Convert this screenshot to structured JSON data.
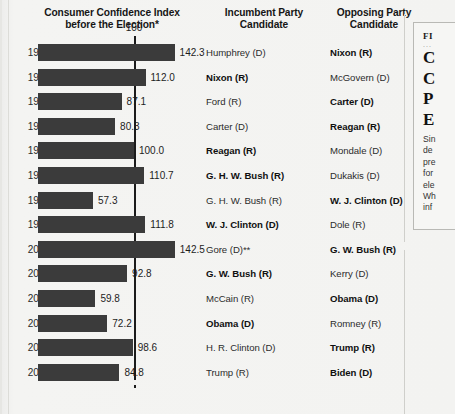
{
  "headers": {
    "chart": "Consumer Confidence Index before the Election*",
    "chart_line1": "Consumer Confidence Index",
    "chart_line2": "before the Election*",
    "incumbent_line1": "Incumbent Party",
    "incumbent_line2": "Candidate",
    "opposing_line1": "Opposing Party",
    "opposing_line2": "Candidate"
  },
  "reference": {
    "label": "100",
    "value": 100
  },
  "side_panel": {
    "kicker": "FI",
    "dots": "...",
    "title_lines": [
      "C",
      "C",
      "P",
      "E"
    ],
    "body_lines": [
      "Sin",
      "de",
      "pre",
      "for",
      "ele",
      "Wh",
      "inf"
    ]
  },
  "chart_data": {
    "type": "bar",
    "title": "Consumer Confidence Index before the Election*",
    "xlabel": "",
    "ylabel": "",
    "orientation": "horizontal",
    "grid": false,
    "reference_line": 100,
    "xlim": [
      0,
      150
    ],
    "categories": [
      "1968",
      "1972",
      "1976",
      "1980",
      "1984",
      "1988",
      "1992",
      "1996",
      "2000",
      "2004",
      "2008",
      "2012",
      "2016",
      "2020"
    ],
    "values": [
      142.3,
      112.0,
      87.1,
      80.3,
      100.0,
      110.7,
      57.3,
      111.8,
      142.5,
      92.8,
      59.8,
      72.2,
      98.6,
      84.8
    ],
    "value_labels": [
      "142.3",
      "112.0",
      "87.1",
      "80.3",
      "100.0",
      "110.7",
      "57.3",
      "111.8",
      "142.5",
      "92.8",
      "59.8",
      "72.2",
      "98.6",
      "84.8"
    ],
    "bar_color": "#3b3b3b",
    "series": [
      {
        "name": "Consumer Confidence Index",
        "values": [
          142.3,
          112.0,
          87.1,
          80.3,
          100.0,
          110.7,
          57.3,
          111.8,
          142.5,
          92.8,
          59.8,
          72.2,
          98.6,
          84.8
        ]
      }
    ]
  },
  "rows": [
    {
      "year": "1968",
      "value_label": "142.3",
      "value": 142.3,
      "incumbent": "Humphrey (D)",
      "incumbent_won": false,
      "opposing": "Nixon (R)",
      "opposing_won": true
    },
    {
      "year": "1972",
      "value_label": "112.0",
      "value": 112.0,
      "incumbent": "Nixon (R)",
      "incumbent_won": true,
      "opposing": "McGovern (D)",
      "opposing_won": false
    },
    {
      "year": "1976",
      "value_label": "87.1",
      "value": 87.1,
      "incumbent": "Ford (R)",
      "incumbent_won": false,
      "opposing": "Carter (D)",
      "opposing_won": true
    },
    {
      "year": "1980",
      "value_label": "80.3",
      "value": 80.3,
      "incumbent": "Carter (D)",
      "incumbent_won": false,
      "opposing": "Reagan (R)",
      "opposing_won": true
    },
    {
      "year": "1984",
      "value_label": "100.0",
      "value": 100.0,
      "incumbent": "Reagan (R)",
      "incumbent_won": true,
      "opposing": "Mondale (D)",
      "opposing_won": false
    },
    {
      "year": "1988",
      "value_label": "110.7",
      "value": 110.7,
      "incumbent": "G. H. W. Bush (R)",
      "incumbent_won": true,
      "opposing": "Dukakis (D)",
      "opposing_won": false
    },
    {
      "year": "1992",
      "value_label": "57.3",
      "value": 57.3,
      "incumbent": "G. H. W. Bush (R)",
      "incumbent_won": false,
      "opposing": "W. J. Clinton (D)",
      "opposing_won": true
    },
    {
      "year": "1996",
      "value_label": "111.8",
      "value": 111.8,
      "incumbent": "W. J. Clinton (D)",
      "incumbent_won": true,
      "opposing": "Dole (R)",
      "opposing_won": false
    },
    {
      "year": "2000",
      "value_label": "142.5",
      "value": 142.5,
      "incumbent": "Gore (D)**",
      "incumbent_won": false,
      "opposing": "G. W. Bush (R)",
      "opposing_won": true
    },
    {
      "year": "2004",
      "value_label": "92.8",
      "value": 92.8,
      "incumbent": "G. W. Bush (R)",
      "incumbent_won": true,
      "opposing": "Kerry (D)",
      "opposing_won": false
    },
    {
      "year": "2008",
      "value_label": "59.8",
      "value": 59.8,
      "incumbent": "McCain (R)",
      "incumbent_won": false,
      "opposing": "Obama (D)",
      "opposing_won": true
    },
    {
      "year": "2012",
      "value_label": "72.2",
      "value": 72.2,
      "incumbent": "Obama (D)",
      "incumbent_won": true,
      "opposing": "Romney (R)",
      "opposing_won": false
    },
    {
      "year": "2016",
      "value_label": "98.6",
      "value": 98.6,
      "incumbent": "H. R. Clinton (D)",
      "incumbent_won": false,
      "opposing": "Trump (R)",
      "opposing_won": true
    },
    {
      "year": "2020",
      "value_label": "84.8",
      "value": 84.8,
      "incumbent": "Trump (R)",
      "incumbent_won": false,
      "opposing": "Biden (D)",
      "opposing_won": true
    }
  ]
}
